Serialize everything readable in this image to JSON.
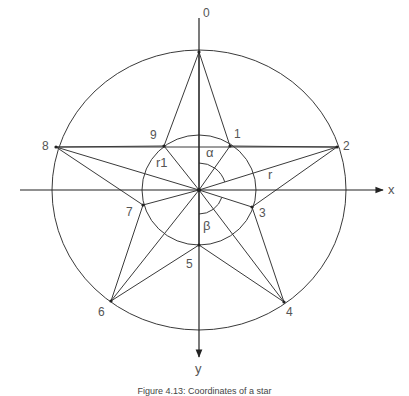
{
  "figure": {
    "caption": "Figure 4.13: Coordinates of a star",
    "colors": {
      "line": "#3a3a3a",
      "text": "#555555",
      "background": "#ffffff"
    },
    "center": {
      "x": 199,
      "y": 190
    },
    "outer_circle": {
      "rx": 147,
      "ry": 140
    },
    "inner_circle": {
      "rx": 57,
      "ry": 55
    },
    "axes": {
      "x": {
        "label": "x",
        "from": [
          20,
          190
        ],
        "to": [
          383,
          190
        ],
        "label_pos": [
          388,
          183
        ]
      },
      "y": {
        "label": "y",
        "from": [
          199,
          18
        ],
        "to": [
          199,
          357
        ],
        "label_pos": [
          195,
          362
        ]
      }
    },
    "points": [
      {
        "id": "0",
        "x": 199,
        "y": 52,
        "label_pos": [
          203,
          7
        ]
      },
      {
        "id": "1",
        "x": 230,
        "y": 146,
        "label_pos": [
          234,
          128
        ]
      },
      {
        "id": "2",
        "x": 337,
        "y": 147,
        "label_pos": [
          343,
          140
        ]
      },
      {
        "id": "3",
        "x": 252,
        "y": 207,
        "label_pos": [
          259,
          207
        ]
      },
      {
        "id": "4",
        "x": 284,
        "y": 302,
        "label_pos": [
          286,
          306
        ]
      },
      {
        "id": "5",
        "x": 199,
        "y": 245,
        "label_pos": [
          186,
          258
        ]
      },
      {
        "id": "6",
        "x": 111,
        "y": 301,
        "label_pos": [
          98,
          306
        ]
      },
      {
        "id": "7",
        "x": 143,
        "y": 205,
        "label_pos": [
          126,
          206
        ]
      },
      {
        "id": "8",
        "x": 56,
        "y": 147,
        "label_pos": [
          42,
          140
        ]
      },
      {
        "id": "9",
        "x": 164,
        "y": 146,
        "label_pos": [
          150,
          129
        ]
      }
    ],
    "extra_lines": [
      [
        "8",
        "2"
      ]
    ],
    "angle_labels": [
      {
        "id": "alpha",
        "text": "α",
        "pos": [
          206,
          146
        ]
      },
      {
        "id": "beta",
        "text": "β",
        "pos": [
          203,
          219
        ]
      }
    ],
    "radius_labels": [
      {
        "id": "r",
        "text": "r",
        "pos": [
          268,
          168
        ]
      },
      {
        "id": "r1",
        "text": "r1",
        "pos": [
          156,
          156
        ]
      }
    ],
    "angle_arcs": [
      {
        "id": "alpha-arc",
        "radius": 27,
        "from_deg": -90,
        "to_point": "2"
      },
      {
        "id": "beta-arc",
        "radius": 24,
        "from_deg": 90,
        "to_point": "3"
      }
    ]
  }
}
